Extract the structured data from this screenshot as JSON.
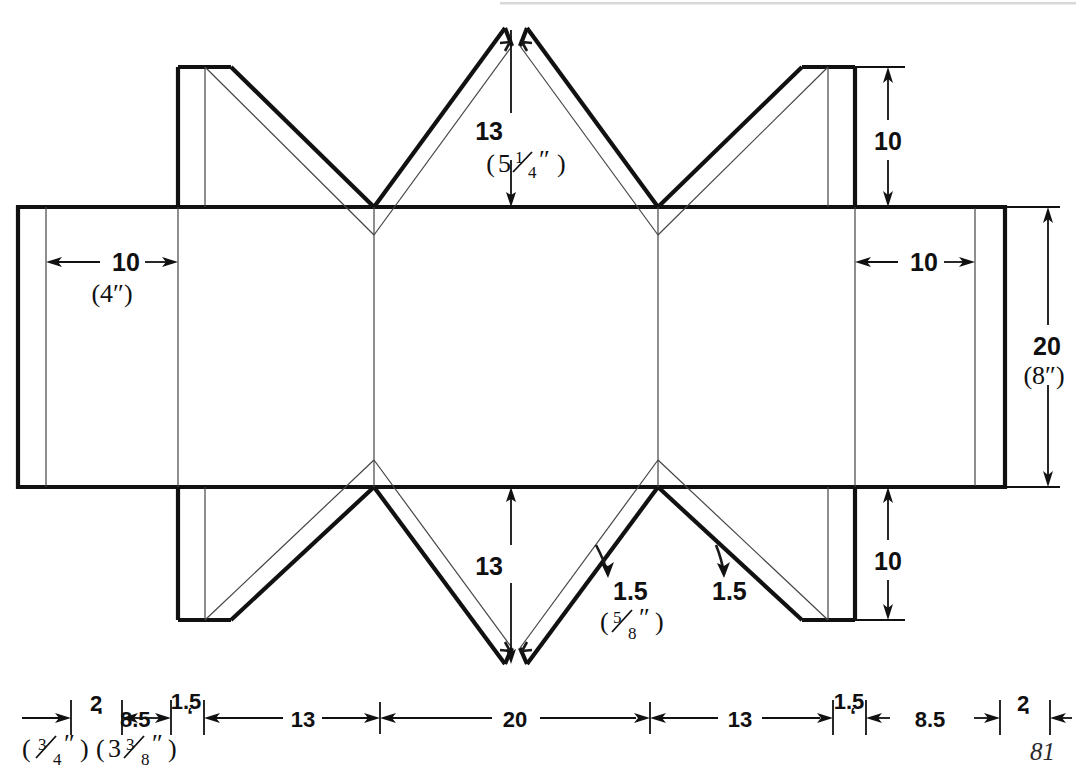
{
  "figure": {
    "page_number": "81",
    "units_note": "metric primary with imperial in parentheses"
  },
  "dimensions": {
    "top_center": {
      "value": "13",
      "imperial": "(5¼″)",
      "imperial_whole": "5",
      "imperial_num": "1",
      "imperial_den": "4"
    },
    "bottom_center": {
      "value": "13"
    },
    "left_panel": {
      "value": "10",
      "imperial": "(4″)"
    },
    "right_panel": {
      "value": "10"
    },
    "right_top_flap": {
      "value": "10"
    },
    "right_bottom_flap": {
      "value": "10"
    },
    "right_height": {
      "value": "20",
      "imperial": "(8″)"
    },
    "fold_gap_left": {
      "value": "1.5",
      "imperial": "(⁵⁄₈″)",
      "imperial_num": "5",
      "imperial_den": "8"
    },
    "fold_gap_right": {
      "value": "1.5"
    }
  },
  "bottom_ruler": {
    "items": [
      {
        "value": "2",
        "imperial_num": "3",
        "imperial_den": "4"
      },
      {
        "value": "8.5",
        "imperial_num": "3",
        "imperial_den": "8",
        "imperial_whole": "3"
      },
      {
        "value": "1.5"
      },
      {
        "value": "13"
      },
      {
        "value": "20"
      },
      {
        "value": "13"
      },
      {
        "value": "1.5"
      },
      {
        "value": "8.5"
      },
      {
        "value": "2"
      }
    ]
  },
  "colors": {
    "line": "#111111",
    "thin_line": "#444444",
    "background": "#ffffff",
    "page_number": "#2a2a2a"
  }
}
